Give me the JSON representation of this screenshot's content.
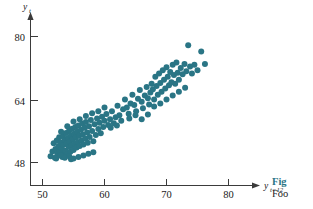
{
  "figure": {
    "background_color": "#ffffff",
    "point_color": "#2a7585",
    "axis_color": "#3b3b3b",
    "accent_color": "#2a7585",
    "caption_fig_label": "Fig",
    "caption_body_text": "Foo"
  },
  "chart_data": {
    "type": "scatter",
    "title": "",
    "xlabel": "y_{t-12}",
    "xlabel_base": "y",
    "xlabel_sub": "t−12",
    "ylabel": "y_t",
    "ylabel_base": "y",
    "ylabel_sub": "t",
    "grid": false,
    "legend": "none",
    "xlim": [
      46,
      84
    ],
    "ylim": [
      42,
      84
    ],
    "xticks": [
      50,
      60,
      70,
      80
    ],
    "yticks": [
      48,
      64,
      80
    ],
    "xtick_labels": [
      "50",
      "60",
      "70",
      "80"
    ],
    "ytick_labels": [
      "48",
      "64",
      "80"
    ],
    "series": [
      {
        "name": "airline passengers lag-12",
        "color": "#2a7585",
        "marker": "circle",
        "marker_size": 3.0,
        "points": [
          [
            51.3,
            49.6
          ],
          [
            51.6,
            50.8
          ],
          [
            51.8,
            52.9
          ],
          [
            52.0,
            49.2
          ],
          [
            52.1,
            51.4
          ],
          [
            52.3,
            53.6
          ],
          [
            52.4,
            50.2
          ],
          [
            52.6,
            52.2
          ],
          [
            52.7,
            54.4
          ],
          [
            52.8,
            50.9
          ],
          [
            53.0,
            53.1
          ],
          [
            53.1,
            51.6
          ],
          [
            53.2,
            49.4
          ],
          [
            53.3,
            54.7
          ],
          [
            53.4,
            52.5
          ],
          [
            53.5,
            50.4
          ],
          [
            53.6,
            53.8
          ],
          [
            53.7,
            51.0
          ],
          [
            53.8,
            55.5
          ],
          [
            53.9,
            52.8
          ],
          [
            54.0,
            50.1
          ],
          [
            54.1,
            54.2
          ],
          [
            54.2,
            52.0
          ],
          [
            54.3,
            56.1
          ],
          [
            54.4,
            53.3
          ],
          [
            54.5,
            50.7
          ],
          [
            54.6,
            54.9
          ],
          [
            54.7,
            52.4
          ],
          [
            54.8,
            56.6
          ],
          [
            54.9,
            53.9
          ],
          [
            55.0,
            51.2
          ],
          [
            55.1,
            55.3
          ],
          [
            55.2,
            52.7
          ],
          [
            55.3,
            57.0
          ],
          [
            55.4,
            54.4
          ],
          [
            55.5,
            51.8
          ],
          [
            55.6,
            55.8
          ],
          [
            55.7,
            53.2
          ],
          [
            55.8,
            57.4
          ],
          [
            55.9,
            54.8
          ],
          [
            56.0,
            52.2
          ],
          [
            56.2,
            56.3
          ],
          [
            56.3,
            53.6
          ],
          [
            56.4,
            57.9
          ],
          [
            56.5,
            55.1
          ],
          [
            56.6,
            52.6
          ],
          [
            56.8,
            56.8
          ],
          [
            56.9,
            54.1
          ],
          [
            57.0,
            58.3
          ],
          [
            57.2,
            55.6
          ],
          [
            57.3,
            53.0
          ],
          [
            57.5,
            57.2
          ],
          [
            57.6,
            54.5
          ],
          [
            57.8,
            58.8
          ],
          [
            58.0,
            56.0
          ],
          [
            58.2,
            53.4
          ],
          [
            58.4,
            57.7
          ],
          [
            58.6,
            55.0
          ],
          [
            58.8,
            59.2
          ],
          [
            59.0,
            56.5
          ],
          [
            59.2,
            58.1
          ],
          [
            59.4,
            55.4
          ],
          [
            59.6,
            59.6
          ],
          [
            59.8,
            57.0
          ],
          [
            60.0,
            58.6
          ],
          [
            60.3,
            60.3
          ],
          [
            60.6,
            57.5
          ],
          [
            60.9,
            59.0
          ],
          [
            61.2,
            61.0
          ],
          [
            61.5,
            58.0
          ],
          [
            61.8,
            59.5
          ],
          [
            62.1,
            62.4
          ],
          [
            62.4,
            60.0
          ],
          [
            62.7,
            58.6
          ],
          [
            63.0,
            61.5
          ],
          [
            63.3,
            64.0
          ],
          [
            63.6,
            62.0
          ],
          [
            63.9,
            60.4
          ],
          [
            64.2,
            63.0
          ],
          [
            64.5,
            65.2
          ],
          [
            64.8,
            62.6
          ],
          [
            65.1,
            61.0
          ],
          [
            65.4,
            64.2
          ],
          [
            65.7,
            66.4
          ],
          [
            66.0,
            63.4
          ],
          [
            66.2,
            61.8
          ],
          [
            66.5,
            65.0
          ],
          [
            66.8,
            67.2
          ],
          [
            67.0,
            64.3
          ],
          [
            67.2,
            62.7
          ],
          [
            67.4,
            65.8
          ],
          [
            67.6,
            68.0
          ],
          [
            67.8,
            66.6
          ],
          [
            68.0,
            64.0
          ],
          [
            68.2,
            69.8
          ],
          [
            68.4,
            67.4
          ],
          [
            68.6,
            65.2
          ],
          [
            68.8,
            70.6
          ],
          [
            69.0,
            68.2
          ],
          [
            69.2,
            66.0
          ],
          [
            69.4,
            71.4
          ],
          [
            69.6,
            69.0
          ],
          [
            69.8,
            66.8
          ],
          [
            70.0,
            72.2
          ],
          [
            70.2,
            69.8
          ],
          [
            70.4,
            67.6
          ],
          [
            70.6,
            71.0
          ],
          [
            70.8,
            68.4
          ],
          [
            71.0,
            72.8
          ],
          [
            71.2,
            70.2
          ],
          [
            71.4,
            68.0
          ],
          [
            71.6,
            73.4
          ],
          [
            71.8,
            70.8
          ],
          [
            72.0,
            69.0
          ],
          [
            72.3,
            72.0
          ],
          [
            72.6,
            70.4
          ],
          [
            72.9,
            73.0
          ],
          [
            73.2,
            71.2
          ],
          [
            73.5,
            77.8
          ],
          [
            73.8,
            72.4
          ],
          [
            74.1,
            70.6
          ],
          [
            74.5,
            72.8
          ],
          [
            75.0,
            71.4
          ],
          [
            75.6,
            76.2
          ],
          [
            76.2,
            73.0
          ],
          [
            52.2,
            49.0
          ],
          [
            52.9,
            49.8
          ],
          [
            53.6,
            49.2
          ],
          [
            54.3,
            49.6
          ],
          [
            55.0,
            49.0
          ],
          [
            55.8,
            49.4
          ],
          [
            56.6,
            49.8
          ],
          [
            57.4,
            50.2
          ],
          [
            58.2,
            50.6
          ],
          [
            54.6,
            48.8
          ],
          [
            53.0,
            55.8
          ],
          [
            54.0,
            57.2
          ],
          [
            55.0,
            58.4
          ],
          [
            56.0,
            59.0
          ],
          [
            57.0,
            59.8
          ],
          [
            58.0,
            60.5
          ],
          [
            59.0,
            61.0
          ],
          [
            60.0,
            62.0
          ],
          [
            61.0,
            56.8
          ],
          [
            62.0,
            57.4
          ],
          [
            64.0,
            59.2
          ],
          [
            65.0,
            60.0
          ],
          [
            66.0,
            59.0
          ],
          [
            67.0,
            60.2
          ],
          [
            68.0,
            62.2
          ],
          [
            69.0,
            63.0
          ],
          [
            70.0,
            64.0
          ],
          [
            71.0,
            65.0
          ],
          [
            72.0,
            66.0
          ],
          [
            73.0,
            67.0
          ]
        ]
      }
    ]
  }
}
